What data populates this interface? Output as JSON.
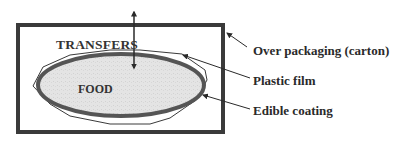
{
  "diagram": {
    "inner_labels": {
      "transfers": "TRANSFERS",
      "food": "FOOD"
    },
    "callouts": [
      {
        "id": "over-packaging",
        "label": "Over packaging (carton)"
      },
      {
        "id": "plastic-film",
        "label": "Plastic film"
      },
      {
        "id": "edible-coating",
        "label": "Edible coating"
      }
    ],
    "colors": {
      "carton_border": "#3a3a3a",
      "edible_coating": "#555555",
      "food_fill": "#e2e2e2",
      "plastic_film": "#3a3a3a",
      "text": "#2a2a2a"
    }
  }
}
